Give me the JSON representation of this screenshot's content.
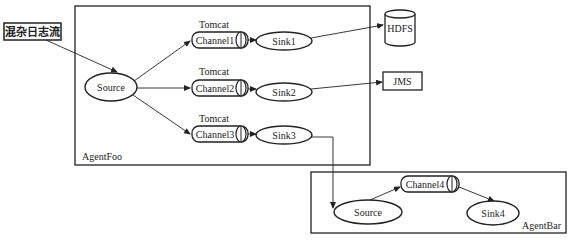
{
  "input": {
    "label": "混杂日志流"
  },
  "agent_foo": {
    "label": "AgentFoo",
    "source": {
      "label": "Source"
    },
    "flows": [
      {
        "group": "Tomcat",
        "channel": "Channel1",
        "sink": "Sink1"
      },
      {
        "group": "Tomcat",
        "channel": "Channel2",
        "sink": "Sink2"
      },
      {
        "group": "Tomcat",
        "channel": "Channel3",
        "sink": "Sink3"
      }
    ]
  },
  "destinations": {
    "hdfs": {
      "label": "HDFS"
    },
    "jms": {
      "label": "JMS"
    }
  },
  "agent_bar": {
    "label": "AgentBar",
    "source": {
      "label": "Source"
    },
    "channel": {
      "label": "Channel4"
    },
    "sink": {
      "label": "Sink4"
    }
  },
  "colors": {
    "stroke": "#222222",
    "background": "#ffffff"
  }
}
